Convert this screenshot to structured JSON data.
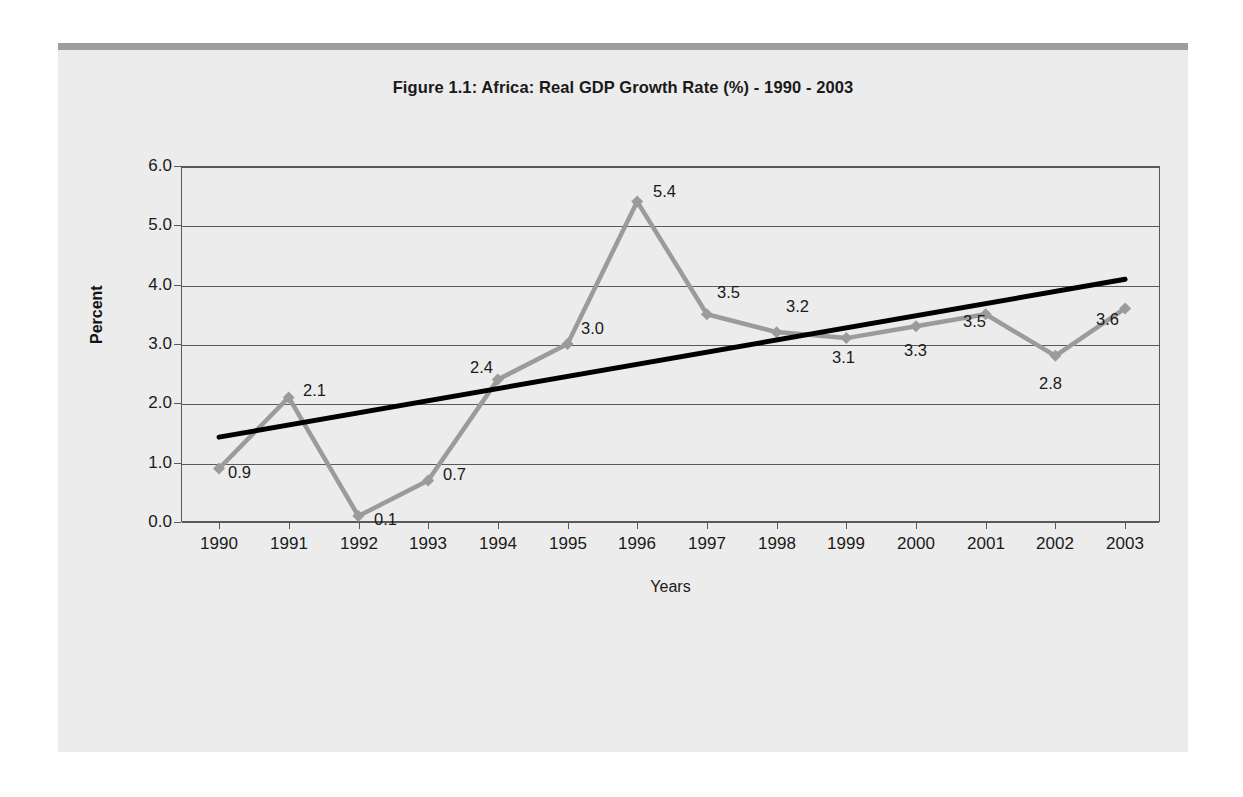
{
  "chart_data": {
    "type": "line",
    "title": "Figure 1.1: Africa: Real GDP Growth Rate (%) - 1990 - 2003",
    "xlabel": "Years",
    "ylabel": "Percent",
    "categories": [
      "1990",
      "1991",
      "1992",
      "1993",
      "1994",
      "1995",
      "1996",
      "1997",
      "1998",
      "1999",
      "2000",
      "2001",
      "2002",
      "2003"
    ],
    "series": [
      {
        "name": "Real GDP Growth Rate (%)",
        "color": "#9b9b9b",
        "marker": "diamond",
        "values": [
          0.9,
          2.1,
          0.1,
          0.7,
          2.4,
          3.0,
          5.4,
          3.5,
          3.2,
          3.1,
          3.3,
          3.5,
          2.8,
          3.6
        ],
        "data_labels": [
          "0.9",
          "2.1",
          "0.1",
          "0.7",
          "2.4",
          "3.0",
          "5.4",
          "3.5",
          "3.2",
          "3.1",
          "3.3",
          "3.5",
          "2.8",
          "3.6"
        ]
      },
      {
        "name": "Linear trend",
        "color": "#000000",
        "marker": "none",
        "trend": true,
        "start_value": 1.43,
        "end_value": 4.09
      }
    ],
    "ylim": [
      0.0,
      6.0
    ],
    "ytick_labels": [
      "0.0",
      "1.0",
      "2.0",
      "3.0",
      "4.0",
      "5.0",
      "6.0"
    ],
    "ytick_values": [
      0,
      1,
      2,
      3,
      4,
      5,
      6
    ],
    "grid": true,
    "grid_axis": "y",
    "legend": "none",
    "legend_position": "none"
  },
  "colors": {
    "series_gray": "#9b9b9b",
    "trend_black": "#000000",
    "axis": "#595959",
    "page_background": "#ececec",
    "top_bar": "#9d9d9d",
    "text": "#1a1a1a"
  }
}
